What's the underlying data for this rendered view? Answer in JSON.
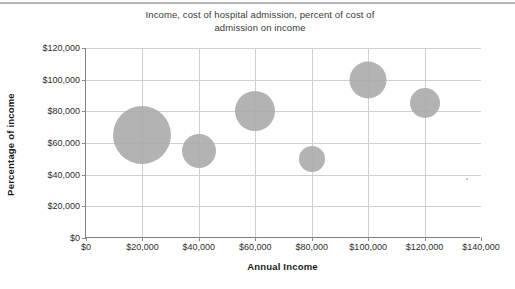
{
  "chart_data": {
    "type": "scatter",
    "subtype": "bubble",
    "title": "Income, cost of hospital admission, percent of cost of admission on income",
    "title_lines": [
      "Income, cost of hospital admission, percent of cost of",
      "admission on income"
    ],
    "xlabel": "Annual Income",
    "ylabel": "Percentage of income",
    "xlim": [
      0,
      140000
    ],
    "ylim": [
      0,
      120000
    ],
    "xticks": [
      "$0",
      "$20,000",
      "$40,000",
      "$60,000",
      "$80,000",
      "$100,000",
      "$120,000",
      "$140,000"
    ],
    "xtick_values": [
      0,
      20000,
      40000,
      60000,
      80000,
      100000,
      120000,
      140000
    ],
    "yticks": [
      "$0",
      "$20,000",
      "$40,000",
      "$60,000",
      "$80,000",
      "$100,000",
      "$120,000"
    ],
    "ytick_values": [
      0,
      20000,
      40000,
      60000,
      80000,
      100000,
      120000
    ],
    "grid": true,
    "legend": false,
    "legend_position": "none",
    "bubble_color": "#adadad",
    "points": [
      {
        "label": "bubble-1",
        "x": 20000,
        "y": 65000,
        "size": 58
      },
      {
        "label": "bubble-2",
        "x": 40000,
        "y": 55000,
        "size": 34
      },
      {
        "label": "bubble-3",
        "x": 60000,
        "y": 80000,
        "size": 40
      },
      {
        "label": "bubble-4",
        "x": 80000,
        "y": 50000,
        "size": 26
      },
      {
        "label": "bubble-5",
        "x": 100000,
        "y": 100000,
        "size": 37
      },
      {
        "label": "bubble-6",
        "x": 120000,
        "y": 85000,
        "size": 30
      },
      {
        "label": "bubble-7",
        "x": 135000,
        "y": 37000,
        "size": 2
      }
    ]
  }
}
